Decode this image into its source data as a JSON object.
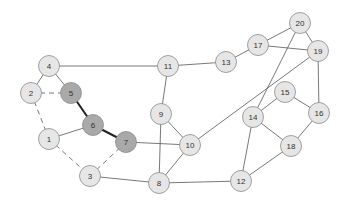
{
  "graph": {
    "colors": {
      "node_fill": "#e6e6e6",
      "node_stroke": "#8a8a8a",
      "highlight_fill": "#a9a9a9",
      "edge": "#555555",
      "bold_edge": "#222222"
    },
    "nodes": [
      {
        "id": "1",
        "highlight": false
      },
      {
        "id": "2",
        "highlight": false
      },
      {
        "id": "3",
        "highlight": false
      },
      {
        "id": "4",
        "highlight": false
      },
      {
        "id": "5",
        "highlight": true
      },
      {
        "id": "6",
        "highlight": true
      },
      {
        "id": "7",
        "highlight": true
      },
      {
        "id": "8",
        "highlight": false
      },
      {
        "id": "9",
        "highlight": false
      },
      {
        "id": "10",
        "highlight": false
      },
      {
        "id": "11",
        "highlight": false
      },
      {
        "id": "12",
        "highlight": false
      },
      {
        "id": "13",
        "highlight": false
      },
      {
        "id": "14",
        "highlight": false
      },
      {
        "id": "15",
        "highlight": false
      },
      {
        "id": "16",
        "highlight": false
      },
      {
        "id": "17",
        "highlight": false
      },
      {
        "id": "18",
        "highlight": false
      },
      {
        "id": "19",
        "highlight": false
      },
      {
        "id": "20",
        "highlight": false
      }
    ],
    "edges": [
      {
        "from": "4",
        "to": "5",
        "style": "solid"
      },
      {
        "from": "4",
        "to": "2",
        "style": "solid"
      },
      {
        "from": "4",
        "to": "11",
        "style": "solid"
      },
      {
        "from": "2",
        "to": "5",
        "style": "dashed"
      },
      {
        "from": "2",
        "to": "1",
        "style": "dashed"
      },
      {
        "from": "5",
        "to": "6",
        "style": "bold"
      },
      {
        "from": "6",
        "to": "7",
        "style": "bold"
      },
      {
        "from": "6",
        "to": "1",
        "style": "solid"
      },
      {
        "from": "1",
        "to": "3",
        "style": "dashed"
      },
      {
        "from": "3",
        "to": "7",
        "style": "dashed"
      },
      {
        "from": "3",
        "to": "8",
        "style": "solid"
      },
      {
        "from": "7",
        "to": "10",
        "style": "solid"
      },
      {
        "from": "8",
        "to": "9",
        "style": "solid"
      },
      {
        "from": "8",
        "to": "10",
        "style": "solid"
      },
      {
        "from": "9",
        "to": "10",
        "style": "solid"
      },
      {
        "from": "9",
        "to": "11",
        "style": "solid"
      },
      {
        "from": "11",
        "to": "13",
        "style": "solid"
      },
      {
        "from": "13",
        "to": "17",
        "style": "solid"
      },
      {
        "from": "17",
        "to": "20",
        "style": "solid"
      },
      {
        "from": "17",
        "to": "19",
        "style": "solid"
      },
      {
        "from": "20",
        "to": "19",
        "style": "solid"
      },
      {
        "from": "20",
        "to": "14",
        "style": "solid"
      },
      {
        "from": "19",
        "to": "10",
        "style": "solid"
      },
      {
        "from": "19",
        "to": "16",
        "style": "solid"
      },
      {
        "from": "15",
        "to": "14",
        "style": "solid"
      },
      {
        "from": "15",
        "to": "16",
        "style": "solid"
      },
      {
        "from": "14",
        "to": "18",
        "style": "solid"
      },
      {
        "from": "16",
        "to": "18",
        "style": "solid"
      },
      {
        "from": "18",
        "to": "12",
        "style": "solid"
      },
      {
        "from": "8",
        "to": "12",
        "style": "solid"
      },
      {
        "from": "14",
        "to": "12",
        "style": "solid"
      }
    ]
  }
}
